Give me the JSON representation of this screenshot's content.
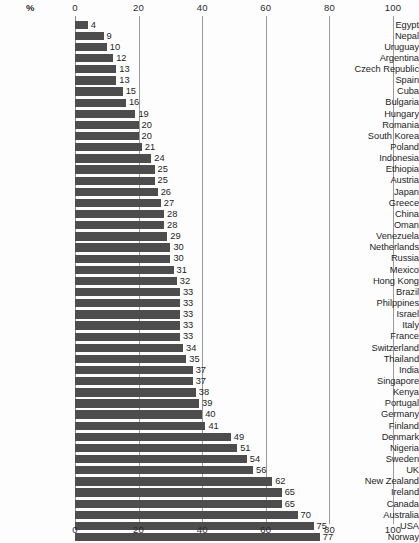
{
  "chart_data": {
    "type": "bar",
    "orientation": "horizontal",
    "title": "",
    "subtitle": "",
    "xlabel": "%",
    "ylabel": "",
    "xlim": [
      0,
      100
    ],
    "xticks": [
      0,
      20,
      40,
      60,
      80,
      100
    ],
    "xtick_labels": [
      "0",
      "20",
      "40",
      "60",
      "80",
      "100"
    ],
    "grid": true,
    "grid_axis": "x",
    "legend": false,
    "legend_position": "none",
    "axis_top": true,
    "axis_bottom": true,
    "bar_color": "#4d4d4d",
    "background_color": "#fdfdfd",
    "value_labels": true,
    "categories": [
      "Egypt",
      "Nepal",
      "Uruguay",
      "Argentina",
      "Czech Republic",
      "Spain",
      "Cuba",
      "Bulgaria",
      "Hungary",
      "Romania",
      "South Korea",
      "Poland",
      "Indonesia",
      "Ethiopia",
      "Austria",
      "Japan",
      "Greece",
      "China",
      "Oman",
      "Venezuela",
      "Netherlands",
      "Russia",
      "Mexico",
      "Hong Kong",
      "Brazil",
      "Philppines",
      "Israel",
      "Italy",
      "France",
      "Switzerland",
      "Thailand",
      "India",
      "Singapore",
      "Kenya",
      "Portugal",
      "Germany",
      "Finland",
      "Denmark",
      "Nigeria",
      "Sweden",
      "UK",
      "New Zealand",
      "Ireland",
      "Canada",
      "Australia",
      "USA",
      "Norway"
    ],
    "values": [
      4,
      9,
      10,
      12,
      13,
      13,
      15,
      16,
      19,
      20,
      20,
      21,
      24,
      25,
      25,
      26,
      27,
      28,
      28,
      29,
      30,
      30,
      31,
      32,
      33,
      33,
      33,
      33,
      33,
      34,
      35,
      37,
      37,
      38,
      39,
      40,
      41,
      49,
      51,
      54,
      56,
      62,
      65,
      65,
      70,
      75,
      77
    ]
  }
}
